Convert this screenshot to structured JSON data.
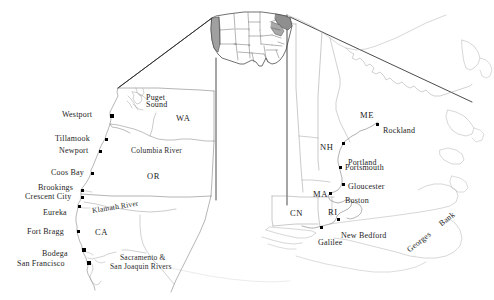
{
  "figure": {
    "type": "map",
    "background_color": "#ffffff",
    "line_color": "#5a5a5a",
    "text_color": "#1c1c1c",
    "shade_color": "#9a9a9a"
  },
  "inset_us_map": {
    "name": "contiguous-united-states-inset",
    "shaded_regions": [
      "west-coast",
      "northeast-coast"
    ]
  },
  "west_map": {
    "title": "West Coast detail",
    "state_labels": [
      {
        "text": "WA",
        "x": 176,
        "y": 118
      },
      {
        "text": "OR",
        "x": 147,
        "y": 172
      },
      {
        "text": "CA",
        "x": 95,
        "y": 228
      }
    ],
    "water_labels": [
      {
        "text": "Puget",
        "x": 146,
        "y": 96
      },
      {
        "text": "Sound",
        "x": 146,
        "y": 103
      }
    ],
    "river_labels": [
      {
        "text": "Columbia River",
        "x": 131,
        "y": 148
      },
      {
        "text": "Klamath River",
        "x": 92,
        "y": 208
      },
      {
        "text": "Sacramento &",
        "x": 120,
        "y": 255
      },
      {
        "text": "San  Joaquin   Rivers",
        "x": 110,
        "y": 264
      }
    ],
    "sites": [
      {
        "name": "Westport",
        "label_x": 62,
        "label_y": 114,
        "dot_x": 110,
        "dot_y": 115
      },
      {
        "name": "Tillamook",
        "label_x": 55,
        "label_y": 138,
        "dot_x": 105,
        "dot_y": 139
      },
      {
        "name": "Newport",
        "label_x": 59,
        "label_y": 150,
        "dot_x": 99,
        "dot_y": 151
      },
      {
        "name": "Coos Bay",
        "label_x": 51,
        "label_y": 172,
        "dot_x": 91,
        "dot_y": 173
      },
      {
        "name": "Brookings",
        "label_x": 38,
        "label_y": 187,
        "dot_x": 81,
        "dot_y": 190
      },
      {
        "name": "Crescent City",
        "label_x": 25,
        "label_y": 196,
        "dot_x": 81,
        "dot_y": 197
      },
      {
        "name": "Eureka",
        "label_x": 43,
        "label_y": 212,
        "dot_x": 78,
        "dot_y": 206
      },
      {
        "name": "Fort  Bragg",
        "label_x": 27,
        "label_y": 231,
        "dot_x": 77,
        "dot_y": 231
      },
      {
        "name": "Bodega",
        "label_x": 42,
        "label_y": 253,
        "dot_x": 82,
        "dot_y": 249
      },
      {
        "name": "San Francisco",
        "label_x": 17,
        "label_y": 263,
        "dot_x": 87,
        "dot_y": 262
      }
    ]
  },
  "east_map": {
    "title": "New England detail",
    "state_labels": [
      {
        "text": "ME",
        "x": 360,
        "y": 114
      },
      {
        "text": "NH",
        "x": 320,
        "y": 146
      },
      {
        "text": "MA",
        "x": 313,
        "y": 193
      },
      {
        "text": "CN",
        "x": 290,
        "y": 212
      },
      {
        "text": "RI",
        "x": 328,
        "y": 211
      }
    ],
    "bank_labels": [
      {
        "text": "Georges",
        "x": 408,
        "y": 248
      },
      {
        "text": "Bank",
        "x": 440,
        "y": 222
      }
    ],
    "sites": [
      {
        "name": "Rockland",
        "label_x": 383,
        "label_y": 129,
        "dot_x": 376,
        "dot_y": 124
      },
      {
        "name": "Portland",
        "label_x": 348,
        "label_y": 161,
        "dot_x": 342,
        "dot_y": 143
      },
      {
        "name": "Portsmouth",
        "label_x": 345,
        "label_y": 166,
        "dot_x": 339,
        "dot_y": 167
      },
      {
        "name": "Gloucester",
        "label_x": 348,
        "label_y": 185,
        "dot_x": 342,
        "dot_y": 184
      },
      {
        "name": "Boston",
        "label_x": 345,
        "label_y": 199,
        "dot_x": 329,
        "dot_y": 193
      },
      {
        "name": "New Bedford",
        "label_x": 341,
        "label_y": 234,
        "dot_x": 337,
        "dot_y": 219
      },
      {
        "name": "Galilee",
        "label_x": 318,
        "label_y": 241,
        "dot_x": 320,
        "dot_y": 227
      }
    ]
  },
  "leader_lines": {
    "count": 4,
    "description": "Four straight lines radiate from the inset US map to the corners of the two enlarged regional maps."
  }
}
